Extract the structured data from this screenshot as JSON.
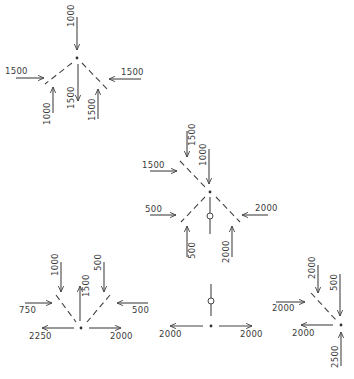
{
  "figure": {
    "colors": {
      "background": "#ffffff",
      "ink": "#444444"
    }
  },
  "diagrams": [
    {
      "id": "node-top-left",
      "labels": [
        "1000",
        "1500",
        "1500",
        "1000",
        "1500",
        "1500"
      ],
      "forces": [
        {
          "label": "1000",
          "direction": "down",
          "position": "top"
        },
        {
          "label": "1500",
          "direction": "right",
          "position": "left"
        },
        {
          "label": "1500",
          "direction": "left",
          "position": "right"
        },
        {
          "label": "1000",
          "direction": "up",
          "position": "lower-left"
        },
        {
          "label": "1500",
          "direction": "down",
          "position": "center-down"
        },
        {
          "label": "1500",
          "direction": "up",
          "position": "lower-right"
        }
      ]
    },
    {
      "id": "node-center",
      "labels": [
        "1500",
        "1000",
        "1500",
        "500",
        "2000",
        "500",
        "2000"
      ],
      "forces": [
        {
          "label": "1500",
          "direction": "down",
          "position": "upper-left-top"
        },
        {
          "label": "1000",
          "direction": "down",
          "position": "top"
        },
        {
          "label": "1500",
          "direction": "right",
          "position": "upper-left"
        },
        {
          "label": "500",
          "direction": "right",
          "position": "lower-left"
        },
        {
          "label": "2000",
          "direction": "left",
          "position": "lower-right"
        },
        {
          "label": "500",
          "direction": "up",
          "position": "bottom-left"
        },
        {
          "label": "2000",
          "direction": "up",
          "position": "bottom-right"
        }
      ]
    },
    {
      "id": "node-bottom-left",
      "labels": [
        "1000",
        "500",
        "1500",
        "750",
        "500",
        "2250",
        "2000"
      ],
      "forces": [
        {
          "label": "1000",
          "direction": "down",
          "position": "upper-left"
        },
        {
          "label": "500",
          "direction": "down",
          "position": "upper-right"
        },
        {
          "label": "1500",
          "direction": "up",
          "position": "center-up"
        },
        {
          "label": "750",
          "direction": "right",
          "position": "left"
        },
        {
          "label": "500",
          "direction": "left",
          "position": "right"
        },
        {
          "label": "2250",
          "direction": "left",
          "position": "bottom-left"
        },
        {
          "label": "2000",
          "direction": "right",
          "position": "bottom-right"
        }
      ]
    },
    {
      "id": "node-bottom-middle",
      "labels": [
        "2000",
        "2000"
      ],
      "forces": [
        {
          "label": "2000",
          "direction": "left",
          "position": "left"
        },
        {
          "label": "2000",
          "direction": "right",
          "position": "right"
        }
      ]
    },
    {
      "id": "node-bottom-right",
      "labels": [
        "2000",
        "500",
        "2000",
        "2000",
        "2500"
      ],
      "forces": [
        {
          "label": "2000",
          "direction": "down",
          "position": "upper-left"
        },
        {
          "label": "500",
          "direction": "down",
          "position": "top"
        },
        {
          "label": "2000",
          "direction": "right",
          "position": "left"
        },
        {
          "label": "2000",
          "direction": "left",
          "position": "bottom-left"
        },
        {
          "label": "2500",
          "direction": "up",
          "position": "bottom"
        }
      ]
    }
  ]
}
